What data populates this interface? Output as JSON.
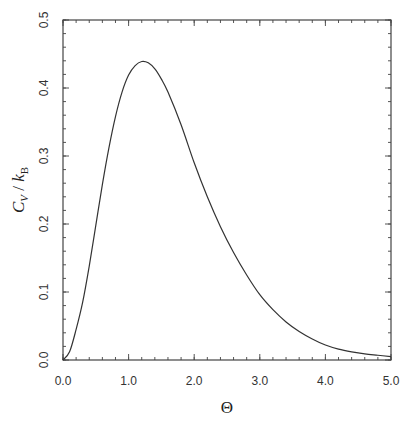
{
  "chart_data": {
    "type": "line",
    "title": "",
    "xlabel": "Θ",
    "ylabel": {
      "main": "C",
      "main_sub": "V",
      "sep": " / ",
      "denom": "k",
      "denom_sub": "B"
    },
    "xlim": [
      0.0,
      5.0
    ],
    "ylim": [
      0.0,
      0.5
    ],
    "xticks": [
      "0.0",
      "1.0",
      "2.0",
      "3.0",
      "4.0",
      "5.0"
    ],
    "yticks": [
      "0.0",
      "0.1",
      "0.2",
      "0.3",
      "0.4",
      "0.5"
    ],
    "x_minor_step": 0.2,
    "y_minor_step": 0.02,
    "grid": false,
    "legend": null,
    "series": [
      {
        "name": "C_V / k_B",
        "color": "#333333",
        "x": [
          0.0,
          0.1,
          0.2,
          0.3,
          0.4,
          0.5,
          0.6,
          0.7,
          0.8,
          0.9,
          1.0,
          1.1,
          1.2,
          1.3,
          1.4,
          1.5,
          1.6,
          1.8,
          2.0,
          2.2,
          2.4,
          2.6,
          2.8,
          3.0,
          3.2,
          3.4,
          3.6,
          3.8,
          4.0,
          4.2,
          4.4,
          4.6,
          4.8,
          5.0
        ],
        "y": [
          0.0,
          0.012,
          0.045,
          0.085,
          0.138,
          0.198,
          0.258,
          0.312,
          0.358,
          0.394,
          0.419,
          0.433,
          0.439,
          0.437,
          0.428,
          0.413,
          0.394,
          0.346,
          0.29,
          0.24,
          0.196,
          0.158,
          0.125,
          0.096,
          0.074,
          0.056,
          0.042,
          0.031,
          0.022,
          0.016,
          0.012,
          0.009,
          0.007,
          0.005
        ]
      }
    ],
    "annotations": []
  }
}
